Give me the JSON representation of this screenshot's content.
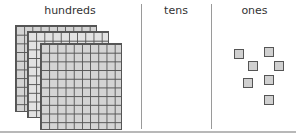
{
  "columns": [
    {
      "label": "hundreds"
    },
    {
      "label": "tens"
    },
    {
      "label": "ones"
    }
  ],
  "hundreds": {
    "count": 3,
    "grid_rows": 10,
    "grid_cols": 10
  },
  "tens": {
    "count": 0
  },
  "ones": {
    "count": 7,
    "positions": [
      [
        234,
        49
      ],
      [
        264,
        47
      ],
      [
        248,
        61
      ],
      [
        274,
        61
      ],
      [
        243,
        78
      ],
      [
        264,
        75
      ],
      [
        264,
        95
      ]
    ]
  },
  "colors": {
    "cell_fill": "#d4d4d4",
    "grid_line": "#555555",
    "divider": "#9a9a9a"
  }
}
